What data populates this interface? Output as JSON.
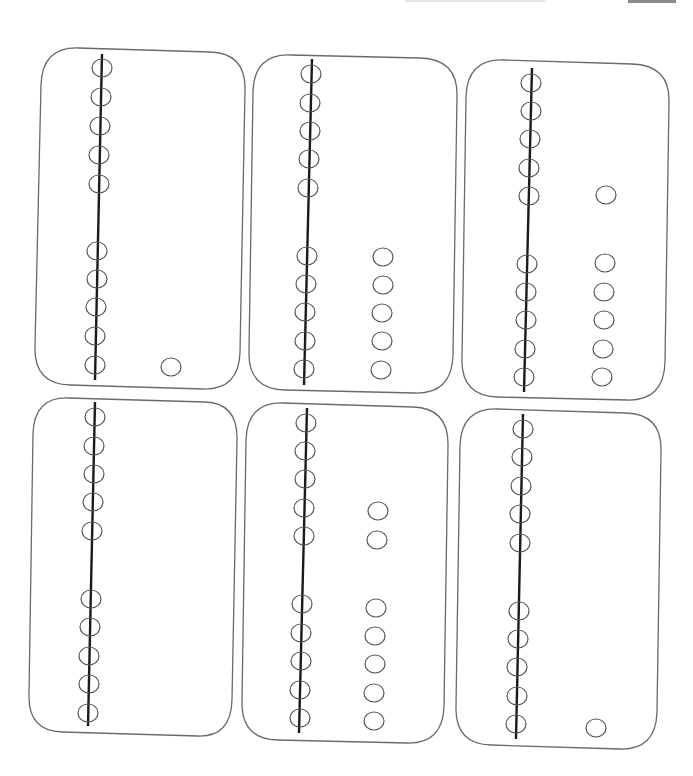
{
  "page": {
    "colors": {
      "card_border": "#6a6a6a",
      "rod": "#1a1a1a",
      "bead": "#555555",
      "background": "#ffffff"
    }
  },
  "cards": [
    {
      "id": 1,
      "rod_beads": 10,
      "loose_beads": 1,
      "value": 11
    },
    {
      "id": 2,
      "rod_beads": 10,
      "loose_beads": 5,
      "value": 15
    },
    {
      "id": 3,
      "rod_beads": 10,
      "loose_beads": 6,
      "value": 16
    },
    {
      "id": 4,
      "rod_beads": 10,
      "loose_beads": 0,
      "value": 10
    },
    {
      "id": 5,
      "rod_beads": 10,
      "loose_beads": 7,
      "value": 17
    },
    {
      "id": 6,
      "rod_beads": 10,
      "loose_beads": 1,
      "value": 11
    }
  ]
}
